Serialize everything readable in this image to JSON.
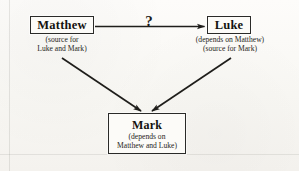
{
  "diagram": {
    "type": "dependency-diagram",
    "title_visible": false,
    "background_color": "#fbfaf7",
    "ink_color": "#1b1b1b",
    "nodes": [
      {
        "id": "matthew",
        "label": "Matthew",
        "caption_lines": [
          "(source for",
          "Luke and Mark)"
        ],
        "position": "top-left"
      },
      {
        "id": "luke",
        "label": "Luke",
        "caption_lines": [
          "(depends on Matthew)",
          "(source for Mark)"
        ],
        "position": "top-right"
      },
      {
        "id": "mark",
        "label": "Mark",
        "caption_lines": [
          "(depends on",
          "Matthew and Luke)"
        ],
        "position": "bottom-center"
      }
    ],
    "edges": [
      {
        "id": "matthew-to-luke",
        "from": "matthew",
        "to": "luke",
        "annotation": "?",
        "style": "solid-arrow",
        "orientation": "horizontal"
      },
      {
        "id": "matthew-to-mark",
        "from": "matthew",
        "to": "mark",
        "annotation": "",
        "style": "solid-arrow",
        "orientation": "diagonal-down-right"
      },
      {
        "id": "luke-to-mark",
        "from": "luke",
        "to": "mark",
        "annotation": "",
        "style": "solid-arrow",
        "orientation": "diagonal-down-left"
      }
    ],
    "annotations": {
      "question_mark": "?"
    }
  }
}
